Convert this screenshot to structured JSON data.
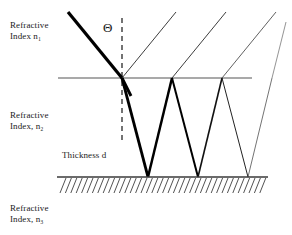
{
  "figure": {
    "type": "optics-ray-diagram",
    "title_shown": false,
    "labels": {
      "medium_1": "Refractive\nIndex n₁",
      "medium_2": "Refractive\nIndex, n₂",
      "medium_3": "Refractive\nIndex, n₃",
      "thickness": "Thickness d",
      "angle": "Θ"
    },
    "colors": {
      "ray_strong": "#000000",
      "ray_faint": "#555555",
      "interface_top": "#555555",
      "interface_bottom": "#444444",
      "hatch": "#333333",
      "normal_dashed": "#000000",
      "text": "#1a1a1a",
      "background": "#ffffff"
    },
    "geometry": {
      "top_interface_y": 78,
      "top_interface_x0": 58,
      "top_interface_x1": 252,
      "bottom_interface_y": 177,
      "bottom_interface_x0": 57,
      "bottom_interface_x1": 268,
      "incidence_point_x": 122,
      "top_vertices_x": [
        122,
        172,
        222
      ],
      "bottom_vertices_x": [
        148,
        198,
        248
      ],
      "normal_x": 122,
      "normal_top_y": 18,
      "normal_bottom_y": 141
    },
    "rays": {
      "incident": {
        "x1": 68,
        "y1": 12,
        "x2": 122,
        "y2": 78,
        "width": 3.2
      },
      "reflected_orders": [
        {
          "from_x": 122,
          "to_x": 176,
          "to_y": 12,
          "width": 0.9
        },
        {
          "from_x": 172,
          "to_x": 226,
          "to_y": 12,
          "width": 0.9
        },
        {
          "from_x": 222,
          "to_x": 276,
          "to_y": 12,
          "width": 0.8
        }
      ],
      "internal_zigzag": [
        {
          "x1": 122,
          "y1": 78,
          "x2": 148,
          "y2": 177,
          "width": 2.8
        },
        {
          "x1": 148,
          "y1": 177,
          "x2": 172,
          "y2": 78,
          "width": 2.4
        },
        {
          "x1": 172,
          "y1": 78,
          "x2": 198,
          "y2": 177,
          "width": 2.0
        },
        {
          "x1": 198,
          "y1": 177,
          "x2": 222,
          "y2": 78,
          "width": 1.6
        },
        {
          "x1": 222,
          "y1": 78,
          "x2": 248,
          "y2": 177,
          "width": 1.0
        },
        {
          "x1": 248,
          "y1": 177,
          "x2": 272,
          "y2": 78,
          "width": 0.7
        }
      ],
      "transmitted_tail": {
        "x1": 122,
        "y1": 78,
        "x2": 131,
        "y2": 95,
        "width": 2.6
      },
      "faint_exit": {
        "x1": 272,
        "y1": 78,
        "x2": 286,
        "y2": 22,
        "width": 0.7
      }
    },
    "hatching": {
      "count": 38,
      "x_start": 60,
      "x_end": 266,
      "y_top": 178,
      "length": 15,
      "slant_dx": 6
    }
  }
}
